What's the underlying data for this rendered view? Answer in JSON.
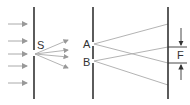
{
  "diagram": {
    "labels": {
      "source_slit": "S",
      "slit_a": "A",
      "slit_b": "B",
      "fringe": "F"
    },
    "colors": {
      "wall": "#333333",
      "ray": "#aaaaaa",
      "incident": "#999999",
      "marker": "#333333"
    }
  }
}
